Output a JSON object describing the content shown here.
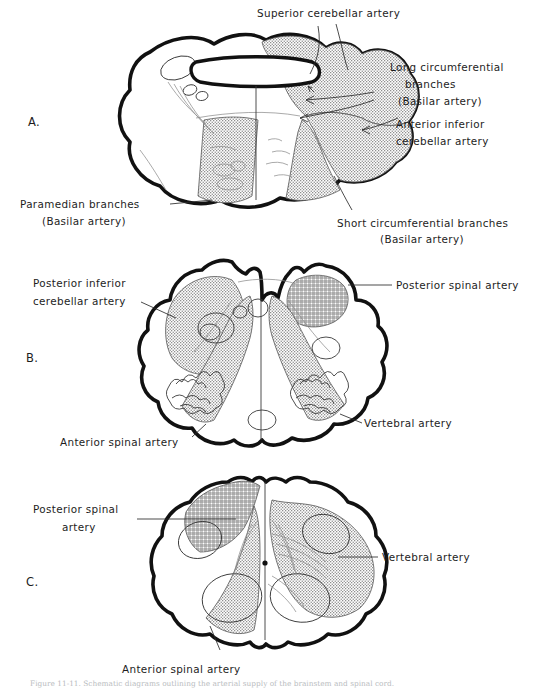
{
  "figure": {
    "title": "Arterial supply of the brainstem and spinal cord",
    "caption": "Figure 11-11. Schematic diagrams outlining the arterial supply of the brainstem and spinal cord.",
    "panels": [
      {
        "id": "A",
        "letter": "A.",
        "subject": "pons",
        "labels": [
          {
            "name": "superior-cerebellar-artery",
            "text": "Superior  cerebellar artery"
          },
          {
            "name": "long-circumferential-branches",
            "line1": "Long circumferential",
            "line2": "branches",
            "line3": "(Basilar artery)"
          },
          {
            "name": "anterior-inferior-cerebellar-artery",
            "line1": "Anterior inferior",
            "line2": "cerebellar artery"
          },
          {
            "name": "paramedian-branches",
            "line1": "Paramedian branches",
            "line2": "(Basilar  artery)"
          },
          {
            "name": "short-circumferential-branches",
            "line1": "Short circumferential branches",
            "line2": "(Basilar artery)"
          }
        ]
      },
      {
        "id": "B",
        "letter": "B.",
        "subject": "medulla",
        "labels": [
          {
            "name": "posterior-inferior-cerebellar-artery",
            "line1": "Posterior  inferior",
            "line2": "cerebellar artery"
          },
          {
            "name": "posterior-spinal-artery",
            "text": "Posterior spinal artery"
          },
          {
            "name": "vertebral-artery",
            "text": "Vertebral artery"
          },
          {
            "name": "anterior-spinal-artery",
            "text": "Anterior  spinal  artery"
          }
        ]
      },
      {
        "id": "C",
        "letter": "C.",
        "subject": "spinal-cord",
        "labels": [
          {
            "name": "posterior-spinal-artery",
            "line1": "Posterior  spinal",
            "line2": "artery"
          },
          {
            "name": "vertebral-artery",
            "text": "Vertebral  artery"
          },
          {
            "name": "anterior-spinal-artery",
            "text": "Anterior spinal artery"
          }
        ]
      }
    ],
    "shading": {
      "stipple_label": "stipple-territory",
      "crosshatch_label": "crosshatch-territory",
      "stipple_color": "#8a8a8a",
      "crosshatch_color": "#5e5e5e",
      "outline_color": "#111111",
      "background": "#ffffff"
    }
  }
}
